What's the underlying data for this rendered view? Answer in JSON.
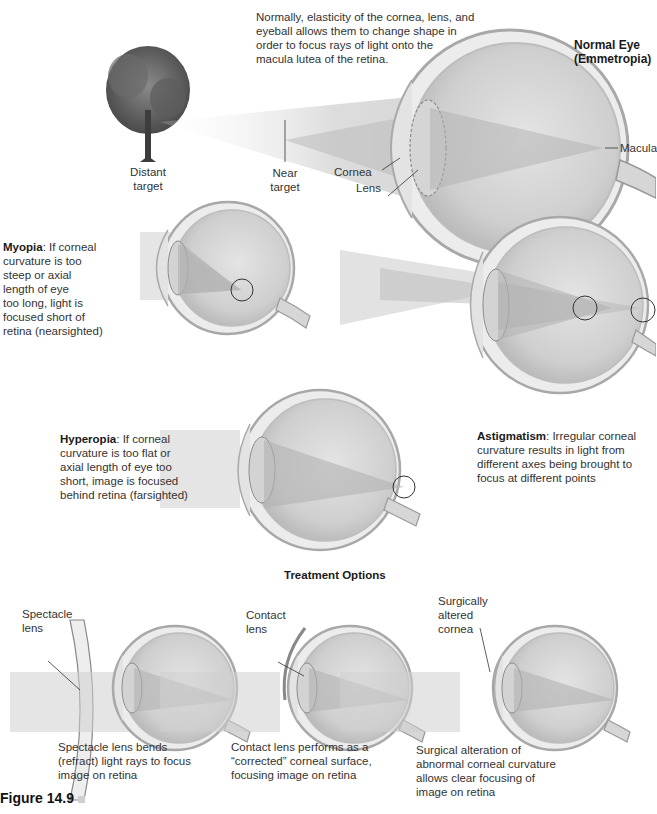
{
  "normal_eye": {
    "title_line1": "Normal Eye",
    "title_line2": "(Emmetropia)",
    "description": "Normally, elasticity of the cornea, lens, and eyeball allows them to change shape in order to focus rays of light onto the macula lutea of the retina.",
    "desc_lines": [
      "Normally, elasticity of the cornea, lens, and",
      "eyeball allows them to change shape in",
      "order to focus rays of light onto the",
      "macula lutea of the retina."
    ],
    "labels": {
      "distant_target": [
        "Distant",
        "target"
      ],
      "near_target": [
        "Near",
        "target"
      ],
      "cornea": "Cornea",
      "lens": "Lens",
      "macula": "Macula"
    }
  },
  "myopia": {
    "term": "Myopia",
    "lines": [
      ": If corneal",
      "curvature is too",
      "steep or axial",
      "length of eye",
      "too long, light is",
      "focused short of",
      "retina (nearsighted)"
    ]
  },
  "hyperopia": {
    "term": "Hyperopia",
    "lines": [
      ": If corneal",
      "curvature is too flat or",
      "axial length of eye too",
      "short, image is focused",
      "behind retina (farsighted)"
    ]
  },
  "astigmatism": {
    "term": "Astigmatism",
    "lines": [
      ": Irregular corneal",
      "curvature results in light from",
      "different axes being brought to",
      "focus at different points"
    ]
  },
  "treatment": {
    "heading": "Treatment Options",
    "options": [
      {
        "label_lines": [
          "Spectacle",
          "lens"
        ],
        "caption_lines": [
          "Spectacle lens bends",
          "(refract) light rays to focus",
          "image on retina"
        ]
      },
      {
        "label_lines": [
          "Contact",
          "lens"
        ],
        "caption_lines": [
          "Contact lens performs as a",
          "“corrected” corneal surface,",
          "focusing image on retina"
        ]
      },
      {
        "label_lines": [
          "Surgically",
          "altered",
          "cornea"
        ],
        "caption_lines": [
          "Surgical alteration of",
          "abnormal corneal curvature",
          "allows clear focusing of",
          "image on retina"
        ]
      }
    ]
  },
  "figure_label": "Figure 14.9",
  "colors": {
    "eye_fill": "#d9d9d9",
    "eye_outline": "#9a9a9a",
    "light_beam": "#c8c8c8",
    "text": "#333333",
    "tree": "#5a5a5a"
  }
}
